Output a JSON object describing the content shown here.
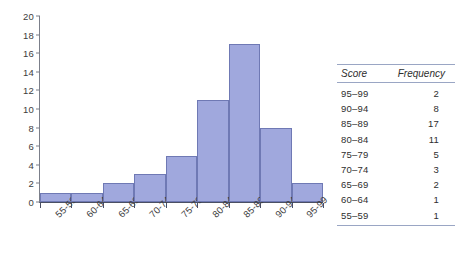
{
  "chart_data": {
    "type": "bar",
    "title": "",
    "xlabel": "",
    "ylabel": "",
    "categories": [
      "55-59",
      "60-64",
      "65-69",
      "70-74",
      "75-79",
      "80-84",
      "85-89",
      "90-94",
      "95-99"
    ],
    "values": [
      1,
      1,
      2,
      3,
      5,
      11,
      17,
      8,
      2
    ],
    "ylim": [
      0,
      20
    ],
    "yticks": [
      0,
      2,
      4,
      6,
      8,
      10,
      12,
      14,
      16,
      18,
      20
    ],
    "ytick_labels": [
      "0",
      "2",
      "4",
      "6",
      "8",
      "10",
      "12",
      "14",
      "16",
      "18",
      "20"
    ],
    "grid": false,
    "legend": null,
    "bar_fill": "#a0a8dd",
    "bar_border": "#6f79b4"
  },
  "table": {
    "headers": {
      "score": "Score",
      "frequency": "Frequency"
    },
    "rows": [
      {
        "score": "95–99",
        "frequency": "2"
      },
      {
        "score": "90–94",
        "frequency": "8"
      },
      {
        "score": "85–89",
        "frequency": "17"
      },
      {
        "score": "80–84",
        "frequency": "11"
      },
      {
        "score": "75–79",
        "frequency": "5"
      },
      {
        "score": "70–74",
        "frequency": "3"
      },
      {
        "score": "65–69",
        "frequency": "2"
      },
      {
        "score": "60–64",
        "frequency": "1"
      },
      {
        "score": "55–59",
        "frequency": "1"
      }
    ],
    "rule_color": "#9aa6c4"
  }
}
